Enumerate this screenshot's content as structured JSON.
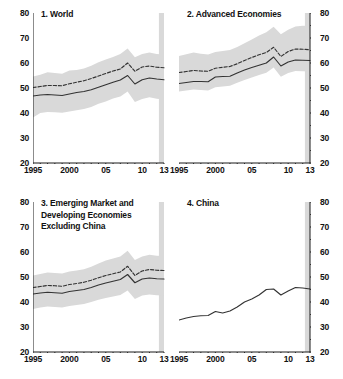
{
  "figure": {
    "background": "#ffffff",
    "band_color": "#d9d9d9",
    "line_color": "#333333",
    "axis_color": "#1a1a1a"
  },
  "axes": {
    "ylim": [
      20,
      80
    ],
    "yticks": [
      20,
      30,
      40,
      50,
      60,
      70,
      80
    ],
    "yticklabels": [
      "20",
      "30",
      "40",
      "50",
      "60",
      "70",
      "80"
    ],
    "yminor_step": 5,
    "xlim": [
      1995,
      2013
    ],
    "xticks": [
      1995,
      2000,
      2005,
      2010,
      2013
    ],
    "xticklabels": [
      "1995",
      "2000",
      "05",
      "10",
      "13"
    ],
    "xminor_step": 1,
    "shaded_forecast_from": 2012.3,
    "shaded_forecast_to": 2013
  },
  "chart_data": [
    {
      "type": "line",
      "panel": 1,
      "title": "1. World",
      "xlabel": "",
      "ylabel": "",
      "xlim": [
        1995,
        2013
      ],
      "ylim": [
        20,
        80
      ],
      "grid": false,
      "legend": "none",
      "yaxis_side": "left",
      "x": [
        1995,
        1996,
        1997,
        1998,
        1999,
        2000,
        2001,
        2002,
        2003,
        2004,
        2005,
        2006,
        2007,
        2008,
        2009,
        2010,
        2011,
        2012,
        2013
      ],
      "series": [
        {
          "name": "Median",
          "style": "solid",
          "values": [
            46.8,
            47.2,
            47.4,
            47.2,
            47.0,
            47.6,
            48.2,
            48.6,
            49.3,
            50.3,
            51.3,
            52.3,
            53.2,
            55.0,
            51.6,
            53.3,
            54.0,
            53.6,
            53.3
          ]
        },
        {
          "name": "Mean",
          "style": "dashed",
          "values": [
            50.2,
            50.6,
            51.0,
            51.0,
            50.9,
            51.7,
            52.3,
            52.9,
            53.8,
            54.8,
            55.8,
            56.8,
            57.6,
            60.0,
            56.7,
            58.4,
            58.8,
            58.3,
            58.1
          ]
        },
        {
          "name": "Interquartile range (upper)",
          "style": "band-upper",
          "values": [
            54.6,
            55.3,
            56.3,
            56.0,
            55.7,
            57.0,
            57.2,
            57.8,
            58.9,
            60.3,
            61.4,
            62.4,
            63.6,
            65.8,
            62.3,
            63.6,
            64.2,
            63.6,
            63.4
          ]
        },
        {
          "name": "Interquartile range (lower)",
          "style": "band-lower",
          "values": [
            38.2,
            40.0,
            40.4,
            40.3,
            40.1,
            40.6,
            41.1,
            41.6,
            42.4,
            43.7,
            44.6,
            45.8,
            46.6,
            48.6,
            44.4,
            45.6,
            46.3,
            45.7,
            45.4
          ]
        }
      ]
    },
    {
      "type": "line",
      "panel": 2,
      "title": "2. Advanced Economies",
      "xlabel": "",
      "ylabel": "",
      "xlim": [
        1995,
        2013
      ],
      "ylim": [
        20,
        80
      ],
      "grid": false,
      "legend": "none",
      "yaxis_side": "right",
      "x": [
        1995,
        1996,
        1997,
        1998,
        1999,
        2000,
        2001,
        2002,
        2003,
        2004,
        2005,
        2006,
        2007,
        2008,
        2009,
        2010,
        2011,
        2012,
        2013
      ],
      "series": [
        {
          "name": "Median",
          "style": "solid",
          "values": [
            51.8,
            52.2,
            52.6,
            52.6,
            52.5,
            54.4,
            54.6,
            54.7,
            56.0,
            57.2,
            58.2,
            59.1,
            60.0,
            62.4,
            58.8,
            60.4,
            61.2,
            61.1,
            61.0
          ]
        },
        {
          "name": "Mean",
          "style": "dashed",
          "values": [
            56.2,
            56.6,
            57.0,
            56.8,
            56.7,
            57.9,
            58.3,
            58.6,
            59.7,
            61.0,
            62.2,
            63.3,
            64.2,
            66.3,
            62.6,
            64.6,
            65.6,
            65.5,
            65.3
          ]
        },
        {
          "name": "Interquartile range (upper)",
          "style": "band-upper",
          "values": [
            62.8,
            63.5,
            64.2,
            63.7,
            63.4,
            64.4,
            64.8,
            65.2,
            66.4,
            67.9,
            69.4,
            71.0,
            72.3,
            74.5,
            71.5,
            73.3,
            74.6,
            74.9,
            74.8
          ]
        },
        {
          "name": "Interquartile range (lower)",
          "style": "band-lower",
          "values": [
            48.6,
            49.0,
            49.4,
            49.2,
            49.0,
            50.3,
            50.6,
            50.9,
            52.1,
            53.2,
            54.2,
            55.2,
            56.1,
            58.2,
            54.5,
            56.0,
            56.8,
            56.7,
            56.6
          ]
        }
      ]
    },
    {
      "type": "line",
      "panel": 3,
      "title": "3. Emerging Market and\n    Developing Economies\n    Excluding China",
      "xlabel": "",
      "ylabel": "",
      "xlim": [
        1995,
        2013
      ],
      "ylim": [
        20,
        80
      ],
      "grid": false,
      "legend": "none",
      "yaxis_side": "left",
      "x": [
        1995,
        1996,
        1997,
        1998,
        1999,
        2000,
        2001,
        2002,
        2003,
        2004,
        2005,
        2006,
        2007,
        2008,
        2009,
        2010,
        2011,
        2012,
        2013
      ],
      "series": [
        {
          "name": "Median",
          "style": "solid",
          "values": [
            43.2,
            43.6,
            43.9,
            43.7,
            43.5,
            44.2,
            44.6,
            45.0,
            45.8,
            46.8,
            47.6,
            48.3,
            49.0,
            51.0,
            47.7,
            49.2,
            49.6,
            49.3,
            49.2
          ]
        },
        {
          "name": "Mean",
          "style": "dashed",
          "values": [
            45.8,
            46.2,
            46.6,
            46.5,
            46.3,
            47.0,
            47.4,
            47.9,
            48.7,
            49.7,
            50.6,
            51.3,
            52.0,
            54.3,
            50.6,
            52.4,
            53.0,
            52.7,
            52.6
          ]
        },
        {
          "name": "Interquartile range (upper)",
          "style": "band-upper",
          "values": [
            50.6,
            51.2,
            51.8,
            51.6,
            51.4,
            52.2,
            52.6,
            53.1,
            54.1,
            55.4,
            56.6,
            57.4,
            58.2,
            60.5,
            56.8,
            58.2,
            58.9,
            58.5,
            58.4
          ]
        },
        {
          "name": "Interquartile range (lower)",
          "style": "band-lower",
          "values": [
            37.2,
            37.8,
            38.2,
            38.0,
            37.8,
            38.4,
            38.8,
            39.2,
            40.0,
            40.9,
            41.6,
            42.2,
            42.8,
            44.6,
            41.2,
            42.6,
            43.0,
            42.7,
            42.6
          ]
        }
      ]
    },
    {
      "type": "line",
      "panel": 4,
      "title": "4. China",
      "xlabel": "",
      "ylabel": "",
      "xlim": [
        1995,
        2013
      ],
      "ylim": [
        20,
        80
      ],
      "grid": false,
      "legend": "none",
      "yaxis_side": "right",
      "x": [
        1995,
        1996,
        1997,
        1998,
        1999,
        2000,
        2001,
        2002,
        2003,
        2004,
        2005,
        2006,
        2007,
        2008,
        2009,
        2010,
        2011,
        2012,
        2013
      ],
      "series": [
        {
          "name": "China",
          "style": "solid",
          "values": [
            32.8,
            33.6,
            34.2,
            34.5,
            34.6,
            36.2,
            35.6,
            36.4,
            38.0,
            40.0,
            41.2,
            42.8,
            45.0,
            45.2,
            42.8,
            44.4,
            45.8,
            45.6,
            45.2
          ]
        }
      ]
    }
  ]
}
